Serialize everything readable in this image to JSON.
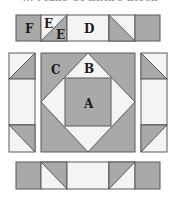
{
  "caption": "… Make Of Entire Block",
  "colors": {
    "gray": "#a9a9a9",
    "light": "#f4f4f4",
    "outline": "#5a5a5a",
    "label": "#1a1a1a"
  },
  "labels": {
    "F": "F",
    "E_top": "E",
    "E_bottom": "E",
    "D": "D",
    "C": "C",
    "B": "B",
    "A": "A"
  },
  "pieces": {
    "top_border": [
      "square F (gray)",
      "half-square triangle E/E",
      "rectangle D (light)",
      "half-square triangle",
      "square (gray)"
    ],
    "left_border": [
      "half-square triangle",
      "rectangle (light)",
      "half-square triangle"
    ],
    "center_block": [
      "square A (gray)",
      "triangles B (light)",
      "corner triangles C (gray)"
    ],
    "right_border": [
      "half-square triangle",
      "rectangle (light)",
      "half-square triangle"
    ],
    "bottom_border": [
      "square (gray)",
      "half-square triangle",
      "rectangle (light)",
      "half-square triangle",
      "square (gray)"
    ]
  }
}
